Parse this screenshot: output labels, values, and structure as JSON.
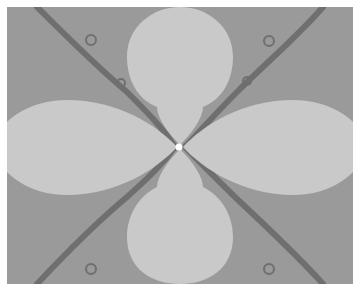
{
  "image": {
    "description": "Grayscale fractal basin plot: four light lobes in a cross arrangement over a medium-gray field, with dark diagonal filaments forming an X and a white point at the center",
    "colors": {
      "margin": "#ffffff",
      "background": "#9a9a9a",
      "lobe": "#c9c9c9",
      "filament": "#6e6e6e",
      "center_point": "#ffffff"
    },
    "lobes": [
      "top",
      "bottom",
      "left",
      "right"
    ]
  }
}
